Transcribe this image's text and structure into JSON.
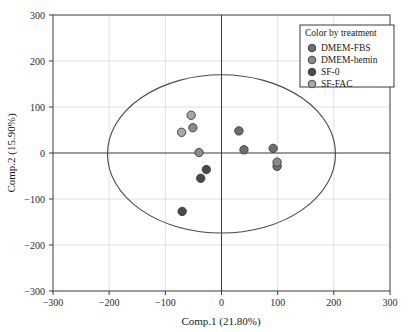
{
  "chart_data": {
    "type": "scatter",
    "title": "",
    "xlabel": "Comp.1 (21.80%)",
    "ylabel": "Comp.2 (15.90%)",
    "xlim": [
      -300,
      300
    ],
    "ylim": [
      -300,
      300
    ],
    "xticks": [
      "-300",
      "-200",
      "-100",
      "0",
      "100",
      "200",
      "300"
    ],
    "yticks": [
      "300",
      "200",
      "100",
      "0",
      "-100",
      "-200",
      "-300"
    ],
    "xtick_values": [
      -300,
      -200,
      -100,
      0,
      100,
      200,
      300
    ],
    "ytick_values": [
      300,
      200,
      100,
      0,
      -100,
      -200,
      -300
    ],
    "grid": true,
    "legend_position": "top-right",
    "legend_title": "Color by treatment",
    "series": [
      {
        "name": "DMEM-FBS",
        "color": "#6e6e6e",
        "points": [
          {
            "x": 31,
            "y": 48
          },
          {
            "x": 40,
            "y": 7
          },
          {
            "x": 92,
            "y": 10
          },
          {
            "x": 99,
            "y": -29
          }
        ]
      },
      {
        "name": "DMEM-hemin",
        "color": "#8a8a8a",
        "points": [
          {
            "x": -51,
            "y": 55
          },
          {
            "x": -40,
            "y": 1
          },
          {
            "x": 99,
            "y": -20
          }
        ]
      },
      {
        "name": "SF-0",
        "color": "#4a4a4a",
        "points": [
          {
            "x": -27,
            "y": -36
          },
          {
            "x": -37,
            "y": -55
          },
          {
            "x": -70,
            "y": -127
          }
        ]
      },
      {
        "name": "SF-FAC",
        "color": "#a8a8a8",
        "points": [
          {
            "x": -54,
            "y": 82
          },
          {
            "x": -71,
            "y": 45
          }
        ]
      }
    ],
    "ellipse": {
      "center_x": 0,
      "center_y": -2,
      "semi_x": 203,
      "semi_y": 172
    }
  },
  "legend": {
    "title": "Color by treatment",
    "entries": [
      {
        "label": "DMEM-FBS",
        "color": "#6e6e6e"
      },
      {
        "label": "DMEM-hemin",
        "color": "#8a8a8a"
      },
      {
        "label": "SF-0",
        "color": "#4a4a4a"
      },
      {
        "label": "SF-FAC",
        "color": "#a8a8a8"
      }
    ]
  },
  "axes": {
    "x_title": "Comp.1 (21.80%)",
    "y_title": "Comp.2 (15.90%)"
  }
}
